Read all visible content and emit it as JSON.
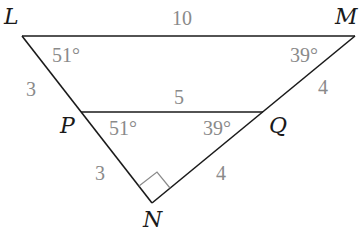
{
  "diagram": {
    "type": "geometry-triangles",
    "colors": {
      "lines": "#1a1a1a",
      "measure_labels": "#8a8a8a",
      "background": "#ffffff"
    },
    "vertices": {
      "L": {
        "label": "L",
        "x": 22,
        "y": 36
      },
      "M": {
        "label": "M",
        "x": 355,
        "y": 36
      },
      "P": {
        "label": "P",
        "x": 81,
        "y": 112
      },
      "Q": {
        "label": "Q",
        "x": 263,
        "y": 112
      },
      "N": {
        "label": "N",
        "x": 152,
        "y": 203
      }
    },
    "segments": {
      "LM": "10",
      "LP": "3",
      "PQ": "5",
      "MQ": "4",
      "PN": "3",
      "QN": "4"
    },
    "angles": {
      "L": "51°",
      "M": "39°",
      "P": "51°",
      "Q": "39°",
      "N": "right-angle"
    }
  }
}
